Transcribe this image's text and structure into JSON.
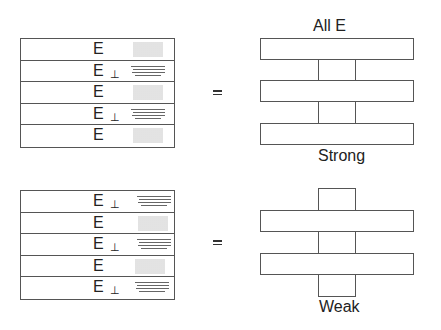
{
  "diagram": {
    "top": {
      "layers": [
        {
          "label": "E",
          "perp": "",
          "pattern": "stipple"
        },
        {
          "label": "E",
          "perp": "⊥",
          "pattern": "stripes"
        },
        {
          "label": "E",
          "perp": "",
          "pattern": "stipple"
        },
        {
          "label": "E",
          "perp": "⊥",
          "pattern": "stripes"
        },
        {
          "label": "E",
          "perp": "",
          "pattern": "stipple"
        }
      ],
      "equals": "=",
      "title": "All  E",
      "caption": "Strong"
    },
    "bottom": {
      "layers": [
        {
          "label": "E",
          "perp": "⊥",
          "pattern": "stripes"
        },
        {
          "label": "E",
          "perp": "",
          "pattern": "stipple"
        },
        {
          "label": "E",
          "perp": "⊥",
          "pattern": "stripes"
        },
        {
          "label": "E",
          "perp": "",
          "pattern": "stipple"
        },
        {
          "label": "E",
          "perp": "⊥",
          "pattern": "stripes"
        }
      ],
      "equals": "=",
      "caption": "Weak"
    }
  }
}
